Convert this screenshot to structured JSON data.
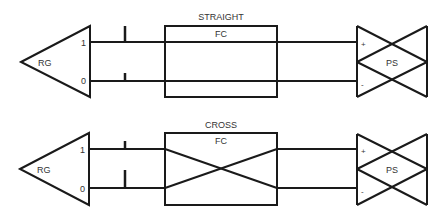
{
  "diagrams": [
    {
      "title": "STRAIGHT",
      "source_label": "RG",
      "box_label": "FC",
      "sink_label": "PS",
      "line_labels": {
        "high": "1",
        "low": "0"
      },
      "polarity": {
        "high": "+",
        "low": "-"
      },
      "wiring": "straight"
    },
    {
      "title": "CROSS",
      "source_label": "RG",
      "box_label": "FC",
      "sink_label": "PS",
      "line_labels": {
        "high": "1",
        "low": "0"
      },
      "polarity": {
        "high": "+",
        "low": "-"
      },
      "wiring": "cross"
    }
  ]
}
